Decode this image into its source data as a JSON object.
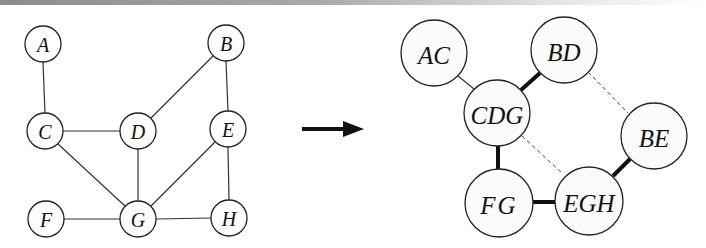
{
  "figure": {
    "arrow_label": ""
  },
  "left_graph": {
    "nodes": [
      {
        "id": "A",
        "label": "A",
        "x": 43,
        "y": 44
      },
      {
        "id": "B",
        "label": "B",
        "x": 226,
        "y": 43
      },
      {
        "id": "C",
        "label": "C",
        "x": 45,
        "y": 131
      },
      {
        "id": "D",
        "label": "D",
        "x": 138,
        "y": 131
      },
      {
        "id": "E",
        "label": "E",
        "x": 228,
        "y": 129
      },
      {
        "id": "F",
        "label": "F",
        "x": 46,
        "y": 219
      },
      {
        "id": "G",
        "label": "G",
        "x": 138,
        "y": 219
      },
      {
        "id": "H",
        "label": "H",
        "x": 229,
        "y": 218
      }
    ],
    "edges": [
      [
        "A",
        "C"
      ],
      [
        "B",
        "D"
      ],
      [
        "B",
        "E"
      ],
      [
        "C",
        "D"
      ],
      [
        "C",
        "G"
      ],
      [
        "D",
        "G"
      ],
      [
        "E",
        "G"
      ],
      [
        "E",
        "H"
      ],
      [
        "F",
        "G"
      ],
      [
        "G",
        "H"
      ]
    ]
  },
  "right_graph": {
    "nodes": [
      {
        "id": "AC",
        "label": "AC",
        "x": 434,
        "y": 53
      },
      {
        "id": "BD",
        "label": "BD",
        "x": 564,
        "y": 50
      },
      {
        "id": "CDG",
        "label": "CDG",
        "x": 497,
        "y": 113
      },
      {
        "id": "BE",
        "label": "BE",
        "x": 654,
        "y": 136
      },
      {
        "id": "FG",
        "label": "FG",
        "x": 499,
        "y": 203
      },
      {
        "id": "EGH",
        "label": "EGH",
        "x": 589,
        "y": 201
      }
    ],
    "edges": [
      {
        "from": "AC",
        "to": "CDG",
        "style": "thin"
      },
      {
        "from": "BD",
        "to": "CDG",
        "style": "thick"
      },
      {
        "from": "BD",
        "to": "BE",
        "style": "dashed"
      },
      {
        "from": "CDG",
        "to": "FG",
        "style": "thick"
      },
      {
        "from": "CDG",
        "to": "EGH",
        "style": "dashed"
      },
      {
        "from": "FG",
        "to": "EGH",
        "style": "thick"
      },
      {
        "from": "BE",
        "to": "EGH",
        "style": "thick"
      }
    ]
  }
}
